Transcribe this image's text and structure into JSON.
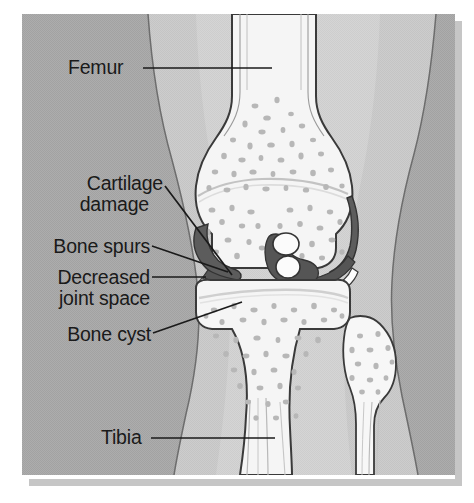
{
  "figure": {
    "type": "medical-anatomical-illustration",
    "view": "anterior coronal cross-section of right knee",
    "background_color": "#a9a9a9",
    "soft_tissue_color": "#c9c9c9",
    "bone_color": "#f4f4f4",
    "trabecular_dot_color": "#b4b4b4",
    "cartilage_color": "#5e5e5e",
    "outline_color": "#3a3a3a",
    "label_color": "#1a1a1a",
    "shadow_color": "#c0c0c0"
  },
  "labels": [
    {
      "id": "femur",
      "text": "Femur",
      "lines": [
        "Femur"
      ],
      "align": "left",
      "x": 68,
      "y": 57,
      "leader": {
        "from_x": 143,
        "from_y": 68,
        "to_x": 272,
        "to_y": 68
      }
    },
    {
      "id": "cartilage-damage",
      "text": "Cartilage damage",
      "lines": [
        "Cartilage",
        "damage"
      ],
      "align": "right",
      "x": 62,
      "y": 173,
      "leader": {
        "from_x": 165,
        "from_y": 186,
        "to_x": 232,
        "to_y": 275
      }
    },
    {
      "id": "bone-spurs",
      "text": "Bone spurs",
      "lines": [
        "Bone spurs"
      ],
      "align": "right",
      "x": 42,
      "y": 236,
      "leader": {
        "from_x": 152,
        "from_y": 246,
        "to_x": 228,
        "to_y": 272
      }
    },
    {
      "id": "decreased-joint-space",
      "text": "Decreased joint space",
      "lines": [
        "Decreased",
        "joint space"
      ],
      "align": "right",
      "x": 41,
      "y": 267,
      "leader": {
        "from_x": 152,
        "from_y": 277,
        "to_x": 206,
        "to_y": 277
      }
    },
    {
      "id": "bone-cyst",
      "text": "Bone cyst",
      "lines": [
        "Bone cyst"
      ],
      "align": "right",
      "x": 57,
      "y": 324,
      "leader": {
        "from_x": 153,
        "from_y": 333,
        "to_x": 242,
        "to_y": 302
      }
    },
    {
      "id": "tibia",
      "text": "Tibia",
      "lines": [
        "Tibia"
      ],
      "align": "left",
      "x": 101,
      "y": 427,
      "leader": {
        "from_x": 151,
        "from_y": 438,
        "to_x": 275,
        "to_y": 438
      }
    }
  ],
  "anatomy": {
    "structures": [
      "femur shaft",
      "femoral condyles",
      "tibial plateau",
      "tibia shaft",
      "fibula head",
      "intercondylar eminence",
      "medial meniscus",
      "lateral meniscus",
      "osteophytes (bone spurs)",
      "subchondral bone cyst",
      "thinned articular cartilage"
    ]
  }
}
